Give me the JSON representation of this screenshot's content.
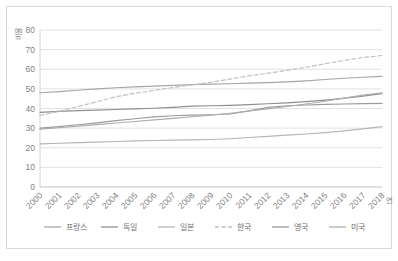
{
  "chart_data": {
    "type": "line",
    "title": "",
    "xlabel": "연도",
    "ylabel": "비율",
    "x": [
      2000,
      2001,
      2002,
      2003,
      2004,
      2005,
      2006,
      2007,
      2008,
      2009,
      2010,
      2011,
      2012,
      2013,
      2014,
      2015,
      2016,
      2017,
      2018
    ],
    "xtick_labels": [
      "2000",
      "2001",
      "2002",
      "2003",
      "2004",
      "2005",
      "2006",
      "2007",
      "2008",
      "2009",
      "2010",
      "2011",
      "2012",
      "2013",
      "2014",
      "2015",
      "2016",
      "2017",
      "2018"
    ],
    "ylim": [
      0,
      80
    ],
    "ytick_labels": [
      "0",
      "10",
      "20",
      "30",
      "40",
      "50",
      "60",
      "70",
      "80"
    ],
    "yticks": [
      0,
      10,
      20,
      30,
      40,
      50,
      60,
      70,
      80
    ],
    "grid": true,
    "legend_position": "bottom",
    "series": [
      {
        "name": "프랑스",
        "color": "#a6a6a6",
        "dash": "none",
        "values": [
          48.0,
          48.6,
          49.3,
          50.0,
          50.6,
          51.0,
          51.4,
          51.8,
          52.2,
          52.4,
          52.6,
          52.9,
          53.2,
          53.6,
          54.1,
          54.8,
          55.4,
          55.9,
          56.4
        ]
      },
      {
        "name": "독일",
        "color": "#8f8f8f",
        "dash": "none",
        "values": [
          38.0,
          38.5,
          38.9,
          39.2,
          39.5,
          39.8,
          40.1,
          40.6,
          41.2,
          41.4,
          41.6,
          42.0,
          42.4,
          42.9,
          43.5,
          44.3,
          45.2,
          46.3,
          47.6
        ]
      },
      {
        "name": "일본",
        "color": "#b5b5b5",
        "dash": "none",
        "values": [
          22.0,
          22.3,
          22.6,
          22.9,
          23.2,
          23.5,
          23.7,
          23.9,
          24.0,
          24.2,
          24.6,
          25.2,
          25.8,
          26.4,
          27.0,
          27.7,
          28.6,
          29.6,
          30.8
        ]
      },
      {
        "name": "한국",
        "color": "#bfbfbf",
        "dash": "dashed",
        "values": [
          36.5,
          38.5,
          41.0,
          43.5,
          46.0,
          47.8,
          49.2,
          50.7,
          52.0,
          53.4,
          55.0,
          56.6,
          58.0,
          59.4,
          61.0,
          62.8,
          64.5,
          66.0,
          67.0
        ]
      },
      {
        "name": "영국",
        "color": "#9b9b9b",
        "dash": "none",
        "values": [
          30.0,
          30.8,
          31.7,
          32.7,
          33.8,
          34.8,
          35.7,
          36.3,
          36.6,
          36.8,
          37.2,
          38.8,
          40.6,
          41.4,
          41.8,
          42.1,
          42.3,
          42.5,
          42.6
        ]
      },
      {
        "name": "미국",
        "color": "#adadad",
        "dash": "none",
        "values": [
          29.5,
          30.2,
          31.0,
          31.8,
          32.6,
          33.4,
          34.2,
          35.0,
          35.8,
          36.6,
          37.6,
          38.7,
          39.8,
          41.0,
          42.3,
          43.7,
          45.3,
          46.8,
          48.0
        ]
      }
    ]
  }
}
